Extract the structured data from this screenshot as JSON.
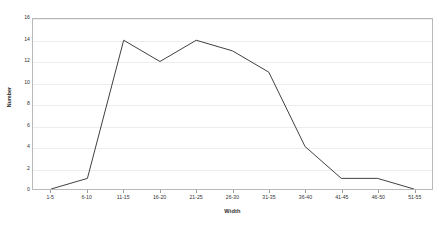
{
  "chart_data": {
    "type": "line",
    "title": "",
    "subtitle": "",
    "xlabel": "Width",
    "ylabel": "Number",
    "categories": [
      "1-5",
      "6-10",
      "11-15",
      "16-20",
      "21-25",
      "26-30",
      "31-35",
      "36-40",
      "41-45",
      "46-50",
      "51-55"
    ],
    "values": [
      0,
      1,
      14,
      12,
      14,
      13,
      11,
      4,
      1,
      1,
      0
    ],
    "series": [
      {
        "name": "Number",
        "values": [
          0,
          1,
          14,
          12,
          14,
          13,
          11,
          4,
          1,
          1,
          0
        ]
      }
    ],
    "ylim": [
      0,
      16
    ],
    "ytick_values": [
      0,
      2,
      4,
      6,
      8,
      10,
      12,
      14,
      16
    ],
    "ytick_labels": [
      "0",
      "2",
      "4",
      "6",
      "8",
      "10",
      "12",
      "14",
      "16"
    ],
    "grid": true,
    "grid_axis": "y",
    "legend": false,
    "legend_position": "none",
    "markers": false,
    "line_color": "#404040",
    "grid_color": "#ededed",
    "axis_color": "#9a9a9a",
    "plot_background": "#ffffff",
    "figure_background": "#ffffff"
  }
}
